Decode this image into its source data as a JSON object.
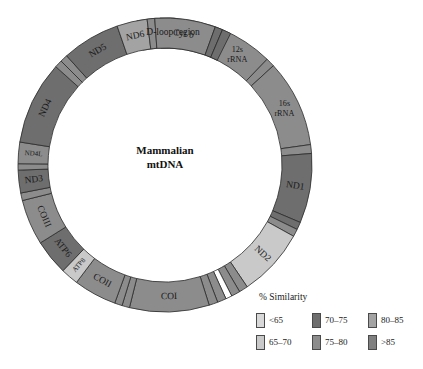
{
  "figure": {
    "center_title_line1": "Mammalian",
    "center_title_line2": "mtDNA",
    "geometry": {
      "cx": 165,
      "cy": 165,
      "outer_r": 147,
      "inner_r": 117
    }
  },
  "palette": {
    "lt65": "#d8d8d8",
    "c65_70": "#c9c9c9",
    "c70_75": "#6e6e6e",
    "c75_80": "#8c8c8c",
    "c80_85": "#a3a3a3",
    "gt85": "#808080",
    "white": "#ffffff",
    "stroke": "#2b2b2b"
  },
  "legend": {
    "title": "% Similarity",
    "items": [
      {
        "label": "<65",
        "color": "#d8d8d8"
      },
      {
        "label": "70–75",
        "color": "#6e6e6e"
      },
      {
        "label": "80–85",
        "color": "#a3a3a3"
      },
      {
        "label": "65–70",
        "color": "#c9c9c9"
      },
      {
        "label": "75–80",
        "color": "#8c8c8c"
      },
      {
        "label": ">85",
        "color": "#808080"
      }
    ]
  },
  "chart_data": {
    "type": "pie",
    "title": "Mammalian mtDNA",
    "subtitle": "Circular mitochondrial genome map shaded by % sequence similarity",
    "legend_position": "bottom-right",
    "units": "degrees of circle (clockwise from 12 o'clock)",
    "segments": [
      {
        "name": "D-loop region",
        "start": 349.0,
        "end": 18.0,
        "color": "#ffffff",
        "label": "D-loop region",
        "label_mode": "horizontal",
        "label_r": 132,
        "similarity": "<65"
      },
      {
        "name": "D-loop dark block",
        "start": 358.0,
        "end": 5.0,
        "color": "#808080",
        "label": "",
        "label_mode": "none",
        "label_r": 132,
        "similarity": ">85"
      },
      {
        "name": "tRNA-1",
        "start": 18.0,
        "end": 22.5,
        "color": "#8c8c8c",
        "label": "",
        "label_mode": "none",
        "label_r": 132,
        "similarity": "75–80"
      },
      {
        "name": "12s rRNA",
        "start": 22.5,
        "end": 44.0,
        "color": "#8c8c8c",
        "label": "12s rRNA",
        "label_mode": "two-line",
        "label_r": 132,
        "similarity": "75–80"
      },
      {
        "name": "tRNA-2",
        "start": 44.0,
        "end": 47.5,
        "color": "#8c8c8c",
        "label": "",
        "label_mode": "none",
        "label_r": 132,
        "similarity": "75–80"
      },
      {
        "name": "16s rRNA",
        "start": 47.5,
        "end": 82.0,
        "color": "#8c8c8c",
        "label": "16s rRNA",
        "label_mode": "two-line",
        "label_r": 132,
        "similarity": "75–80"
      },
      {
        "name": "tRNA-3",
        "start": 82.0,
        "end": 85.5,
        "color": "#8c8c8c",
        "label": "",
        "label_mode": "none",
        "label_r": 132,
        "similarity": "75–80"
      },
      {
        "name": "ND1",
        "start": 85.5,
        "end": 113.0,
        "color": "#6e6e6e",
        "label": "ND1",
        "label_mode": "radial",
        "label_r": 132,
        "similarity": "70–75"
      },
      {
        "name": "tRNA-4",
        "start": 113.0,
        "end": 116.0,
        "color": "#6e6e6e",
        "label": "",
        "label_mode": "none",
        "label_r": 132,
        "similarity": "70–75"
      },
      {
        "name": "tRNA-5",
        "start": 116.0,
        "end": 119.0,
        "color": "#8c8c8c",
        "label": "",
        "label_mode": "none",
        "label_r": 132,
        "similarity": "75–80"
      },
      {
        "name": "ND2",
        "start": 119.0,
        "end": 146.0,
        "color": "#c9c9c9",
        "label": "ND2",
        "label_mode": "radial",
        "label_r": 132,
        "similarity": "65–70"
      },
      {
        "name": "tRNA-6",
        "start": 146.0,
        "end": 149.5,
        "color": "#8c8c8c",
        "label": "",
        "label_mode": "none",
        "label_r": 132,
        "similarity": "75–80"
      },
      {
        "name": "tRNA-7",
        "start": 149.5,
        "end": 153.0,
        "color": "#8c8c8c",
        "label": "",
        "label_mode": "none",
        "label_r": 132,
        "similarity": "75–80"
      },
      {
        "name": "tRNA-gap",
        "start": 153.0,
        "end": 155.5,
        "color": "#ffffff",
        "label": "",
        "label_mode": "none",
        "label_r": 132,
        "similarity": "<65"
      },
      {
        "name": "tRNA-8",
        "start": 155.5,
        "end": 159.0,
        "color": "#8c8c8c",
        "label": "",
        "label_mode": "none",
        "label_r": 132,
        "similarity": "75–80"
      },
      {
        "name": "tRNA-9",
        "start": 159.0,
        "end": 162.5,
        "color": "#8c8c8c",
        "label": "",
        "label_mode": "none",
        "label_r": 132,
        "similarity": "75–80"
      },
      {
        "name": "COI",
        "start": 162.5,
        "end": 194.0,
        "color": "#8c8c8c",
        "label": "COI",
        "label_mode": "tangential",
        "label_r": 132,
        "similarity": "75–80"
      },
      {
        "name": "tRNA-10",
        "start": 194.0,
        "end": 197.0,
        "color": "#8c8c8c",
        "label": "",
        "label_mode": "none",
        "label_r": 132,
        "similarity": "75–80"
      },
      {
        "name": "tRNA-11",
        "start": 197.0,
        "end": 200.0,
        "color": "#8c8c8c",
        "label": "",
        "label_mode": "none",
        "label_r": 132,
        "similarity": "75–80"
      },
      {
        "name": "COII",
        "start": 200.0,
        "end": 217.0,
        "color": "#8c8c8c",
        "label": "COII",
        "label_mode": "tangential",
        "label_r": 132,
        "similarity": "75–80"
      },
      {
        "name": "ATP8",
        "start": 217.0,
        "end": 224.0,
        "color": "#c9c9c9",
        "label": "ATP8",
        "label_mode": "radial",
        "label_r": 132,
        "similarity": "65–70"
      },
      {
        "name": "ATP6",
        "start": 224.0,
        "end": 238.0,
        "color": "#6e6e6e",
        "label": "ATP6",
        "label_mode": "tangential",
        "label_r": 132,
        "similarity": "70–75"
      },
      {
        "name": "COIII",
        "start": 238.0,
        "end": 256.0,
        "color": "#8c8c8c",
        "label": "COIII",
        "label_mode": "tangential",
        "label_r": 132,
        "similarity": "75–80"
      },
      {
        "name": "tRNA-12",
        "start": 256.0,
        "end": 259.0,
        "color": "#8c8c8c",
        "label": "",
        "label_mode": "none",
        "label_r": 132,
        "similarity": "75–80"
      },
      {
        "name": "ND3",
        "start": 259.0,
        "end": 268.0,
        "color": "#6e6e6e",
        "label": "ND3",
        "label_mode": "radial",
        "label_r": 132,
        "similarity": "70–75"
      },
      {
        "name": "tRNA-13",
        "start": 268.0,
        "end": 270.5,
        "color": "#8c8c8c",
        "label": "",
        "label_mode": "none",
        "label_r": 132,
        "similarity": "75–80"
      },
      {
        "name": "ND4L",
        "start": 270.5,
        "end": 279.0,
        "color": "#8c8c8c",
        "label": "ND4L",
        "label_mode": "radial",
        "label_r": 132,
        "similarity": "75–80"
      },
      {
        "name": "ND4",
        "start": 279.0,
        "end": 312.0,
        "color": "#6e6e6e",
        "label": "ND4",
        "label_mode": "tangential",
        "label_r": 132,
        "similarity": "70–75"
      },
      {
        "name": "tRNA-14",
        "start": 312.0,
        "end": 315.0,
        "color": "#8c8c8c",
        "label": "",
        "label_mode": "none",
        "label_r": 132,
        "similarity": "75–80"
      },
      {
        "name": "tRNA-15",
        "start": 315.0,
        "end": 318.0,
        "color": "#8c8c8c",
        "label": "",
        "label_mode": "none",
        "label_r": 132,
        "similarity": "75–80"
      },
      {
        "name": "ND5",
        "start": 318.0,
        "end": 341.0,
        "color": "#6e6e6e",
        "label": "ND5",
        "label_mode": "tangential",
        "label_r": 132,
        "similarity": "70–75"
      },
      {
        "name": "ND6",
        "start": 341.0,
        "end": 353.0,
        "color": "#a3a3a3",
        "label": "ND6",
        "label_mode": "tangential",
        "label_r": 132,
        "similarity": "80–85"
      },
      {
        "name": "tRNA-16",
        "start": 353.0,
        "end": 356.0,
        "color": "#8c8c8c",
        "label": "",
        "label_mode": "none",
        "label_r": 132,
        "similarity": "75–80"
      },
      {
        "name": "Cyt b",
        "start": 356.0,
        "end": 20.0,
        "color": "#8c8c8c",
        "label": "Cyt b",
        "label_mode": "tangential",
        "label_r": 132,
        "similarity": "75–80"
      },
      {
        "name": "tRNA-17",
        "start": 20.0,
        "end": 23.0,
        "color": "#6e6e6e",
        "label": "",
        "label_mode": "none",
        "label_r": 132,
        "similarity": "70–75"
      },
      {
        "name": "tRNA-18",
        "start": 23.0,
        "end": 26.5,
        "color": "#6e6e6e",
        "label": "",
        "label_mode": "none",
        "label_r": 132,
        "similarity": "70–75"
      }
    ]
  }
}
